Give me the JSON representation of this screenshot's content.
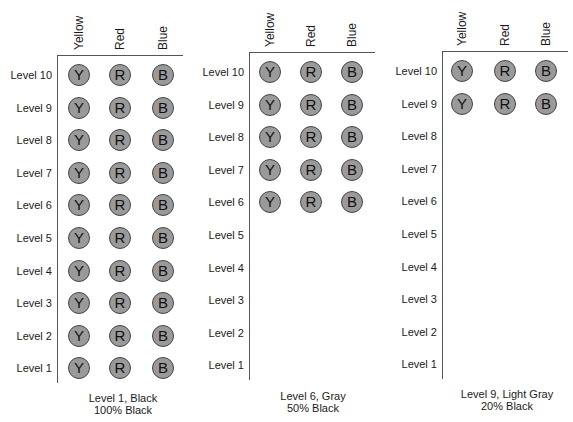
{
  "columns": [
    "Yellow",
    "Red",
    "Blue"
  ],
  "circle_letters": [
    "Y",
    "R",
    "B"
  ],
  "circle_fill": "#9a9a9a",
  "levels": [
    "Level 10",
    "Level 9",
    "Level 8",
    "Level 7",
    "Level 6",
    "Level 5",
    "Level 4",
    "Level 3",
    "Level 2",
    "Level 1"
  ],
  "panels": [
    {
      "caption_line1": "Level 1, Black",
      "caption_line2": "100% Black",
      "filled_levels": [
        "Level 10",
        "Level 9",
        "Level 8",
        "Level 7",
        "Level 6",
        "Level 5",
        "Level 4",
        "Level 3",
        "Level 2",
        "Level 1"
      ]
    },
    {
      "caption_line1": "Level 6, Gray",
      "caption_line2": "50% Black",
      "filled_levels": [
        "Level 10",
        "Level 9",
        "Level 8",
        "Level 7",
        "Level 6"
      ]
    },
    {
      "caption_line1": "Level 9, Light Gray",
      "caption_line2": "20% Black",
      "filled_levels": [
        "Level 10",
        "Level 9"
      ]
    }
  ],
  "layout": [
    {
      "vx": 57,
      "top": 55,
      "bottom": 383,
      "lineEnd": 183,
      "row0": 75,
      "rowStep": 32.6,
      "cx": [
        79,
        120,
        163
      ],
      "captionCx": 123,
      "captionY": 392
    },
    {
      "vx": 249,
      "top": 52,
      "bottom": 380,
      "lineEnd": 375,
      "row0": 72,
      "rowStep": 32.6,
      "cx": [
        270,
        311,
        352
      ],
      "captionCx": 313,
      "captionY": 390
    },
    {
      "vx": 442,
      "top": 51,
      "bottom": 379,
      "lineEnd": 568,
      "row0": 71,
      "rowStep": 32.6,
      "cx": [
        462,
        505,
        546
      ],
      "captionCx": 507,
      "captionY": 388
    }
  ]
}
